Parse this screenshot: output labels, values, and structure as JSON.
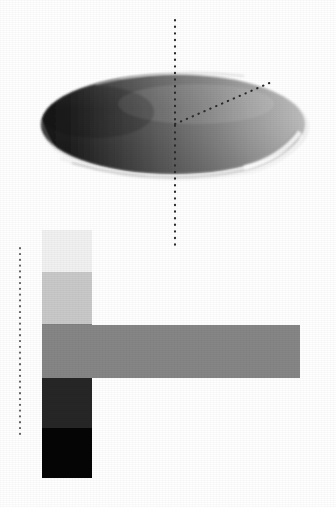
{
  "figure": {
    "background_color": "#ffffff",
    "width": 336,
    "height": 507
  },
  "ellipsoid": {
    "name": "shaded-oblate-ellipsoid",
    "center_x": 173,
    "center_y": 124,
    "radius_x": 132,
    "radius_y": 50,
    "shading": "horizontal-gradient-dark-left-to-light-right",
    "color_dark": "#1d1d1d",
    "color_mid": "#6e6e6e",
    "color_light": "#b9b9b9",
    "rim_highlight_color": "#f7f7f7",
    "rim_shadow_color": "#9a9a9a"
  },
  "axis_lines": {
    "vertical_axis": {
      "name": "vertical-dotted-axis",
      "x": 175,
      "y_start": 20,
      "y_end": 248,
      "style": "dotted",
      "color": "#2a2a2a"
    },
    "radius_line": {
      "name": "diagonal-dotted-radius",
      "x_start": 175,
      "y_start": 124,
      "x_end": 274,
      "y_end": 81,
      "style": "dotted",
      "color": "#2a2a2a"
    },
    "left_axis": {
      "name": "left-vertical-dotted-axis",
      "x": 20,
      "y_start": 248,
      "y_end": 438,
      "style": "dotted",
      "color": "#4a4a4a"
    }
  },
  "vertical_scale": {
    "name": "vertical-grayscale-bar",
    "x": 42,
    "width": 50,
    "y_top": 230,
    "y_bottom": 478,
    "bands": [
      {
        "label": "band-1-lightest",
        "color": "#f1f1f1",
        "y": 230,
        "height": 42
      },
      {
        "label": "band-2-light",
        "color": "#c9c9c9",
        "y": 272,
        "height": 52
      },
      {
        "label": "band-3-mid",
        "color": "#818181",
        "y": 324,
        "height": 54
      },
      {
        "label": "band-4-dark",
        "color": "#262626",
        "y": 378,
        "height": 50
      },
      {
        "label": "band-5-black",
        "color": "#050505",
        "y": 428,
        "height": 50
      }
    ]
  },
  "horizontal_scale": {
    "name": "horizontal-grayscale-bar",
    "x": 42,
    "y": 325,
    "width": 258,
    "height": 53,
    "color": "#868686"
  }
}
